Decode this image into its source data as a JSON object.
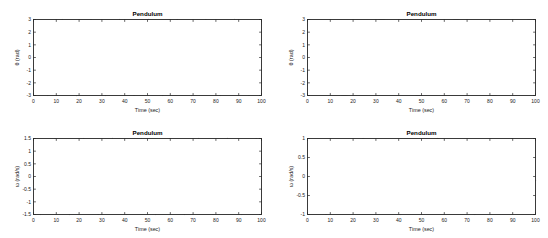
{
  "figure": {
    "background_color": "#ffffff",
    "curve_color": "#3d3d3d",
    "grid_color": "#e6e6e6",
    "axis_color": "#262626",
    "panel_count": 4
  },
  "chart_data": [
    {
      "id": "theta-small-amplitude",
      "position": "top-left",
      "type": "line",
      "title": "Pendulum",
      "xlabel": "Time (sec)",
      "ylabel": "θ (rad)",
      "xlim": [
        0,
        100
      ],
      "ylim": [
        -3,
        3
      ],
      "xticks": [
        0,
        10,
        20,
        30,
        40,
        50,
        60,
        70,
        80,
        90,
        100
      ],
      "xticklabels": [
        "0",
        "10",
        "20",
        "30",
        "40",
        "50",
        "60",
        "70",
        "80",
        "90",
        "100"
      ],
      "yticks": [
        -3,
        -2,
        -1,
        0,
        1,
        2,
        3
      ],
      "yticklabels": [
        "-3",
        "-2",
        "-1",
        "0",
        "1",
        "2",
        "3"
      ],
      "grid": true,
      "legend": null,
      "series": [
        {
          "name": "theta",
          "waveform": "cosine",
          "amplitude": 3.0,
          "period": 12.6,
          "phase_deg": 0,
          "offset": 0,
          "shape_exponent": 1.0
        }
      ]
    },
    {
      "id": "theta-large-amplitude",
      "position": "top-right",
      "type": "line",
      "title": "Pendulum",
      "xlabel": "Time (sec)",
      "ylabel": "θ (rad)",
      "xlim": [
        0,
        100
      ],
      "ylim": [
        -3,
        3
      ],
      "xticks": [
        0,
        10,
        20,
        30,
        40,
        50,
        60,
        70,
        80,
        90,
        100
      ],
      "xticklabels": [
        "0",
        "10",
        "20",
        "30",
        "40",
        "50",
        "60",
        "70",
        "80",
        "90",
        "100"
      ],
      "yticks": [
        -3,
        -2,
        -1,
        0,
        1,
        2,
        3
      ],
      "yticklabels": [
        "-3",
        "-2",
        "-1",
        "0",
        "1",
        "2",
        "3"
      ],
      "grid": true,
      "legend": null,
      "series": [
        {
          "name": "theta",
          "waveform": "flattened-cosine",
          "amplitude": 3.0,
          "period": 32.6,
          "phase_deg": 0,
          "offset": 0,
          "shape_exponent": 0.42
        }
      ]
    },
    {
      "id": "omega-small-amplitude",
      "position": "bottom-left",
      "type": "line",
      "title": "Pendulum",
      "xlabel": "Time (sec)",
      "ylabel": "ω (rad/s)",
      "xlim": [
        0,
        100
      ],
      "ylim": [
        -1.5,
        1.5
      ],
      "xticks": [
        0,
        10,
        20,
        30,
        40,
        50,
        60,
        70,
        80,
        90,
        100
      ],
      "xticklabels": [
        "0",
        "10",
        "20",
        "30",
        "40",
        "50",
        "60",
        "70",
        "80",
        "90",
        "100"
      ],
      "yticks": [
        -1.5,
        -1,
        -0.5,
        0,
        0.5,
        1,
        1.5
      ],
      "yticklabels": [
        "-1.5",
        "-1",
        "-0.5",
        "0",
        "0.5",
        "1",
        "1.5"
      ],
      "grid": true,
      "legend": null,
      "series": [
        {
          "name": "omega",
          "waveform": "negative-sine",
          "amplitude": 1.5,
          "period": 12.6,
          "phase_deg": 0,
          "offset": 0,
          "shape_exponent": 1.0
        }
      ]
    },
    {
      "id": "omega-large-amplitude",
      "position": "bottom-right",
      "type": "line",
      "title": "Pendulum",
      "xlabel": "Time (sec)",
      "ylabel": "ω (rad/s)",
      "xlim": [
        0,
        100
      ],
      "ylim": [
        -1,
        1
      ],
      "xticks": [
        0,
        10,
        20,
        30,
        40,
        50,
        60,
        70,
        80,
        90,
        100
      ],
      "xticklabels": [
        "0",
        "10",
        "20",
        "30",
        "40",
        "50",
        "60",
        "70",
        "80",
        "90",
        "100"
      ],
      "yticks": [
        -1,
        -0.5,
        0,
        0.5,
        1
      ],
      "yticklabels": [
        "-1",
        "-0.5",
        "0",
        "0.5",
        "1"
      ],
      "grid": true,
      "legend": null,
      "series": [
        {
          "name": "omega",
          "waveform": "cusped-negative-sine",
          "amplitude": 1.0,
          "period": 32.6,
          "phase_deg": 0,
          "offset": 0,
          "shape_exponent": 2.6
        }
      ]
    }
  ]
}
